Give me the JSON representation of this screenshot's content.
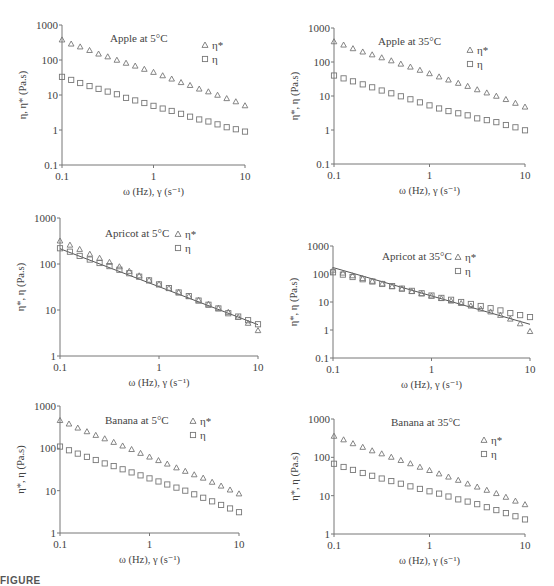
{
  "chart_data": [
    {
      "id": "apple5",
      "type": "scatter",
      "title": "Apple at 5°C",
      "xlabel": "ω (Hz), γ (s⁻¹)",
      "ylabel": "η, η* (Pa.s)",
      "xscale": "log",
      "yscale": "log",
      "xlim": [
        0.1,
        10
      ],
      "ylim": [
        0.1,
        1000
      ],
      "xticks": [
        "0.1",
        "1",
        "10"
      ],
      "yticks": [
        "0.1",
        "1",
        "10",
        "100",
        "1000"
      ],
      "legend": [
        {
          "marker": "triangle",
          "label": "η*"
        },
        {
          "marker": "square",
          "label": "η"
        }
      ],
      "x": [
        0.1,
        0.126,
        0.158,
        0.2,
        0.251,
        0.316,
        0.398,
        0.501,
        0.631,
        0.794,
        1.0,
        1.26,
        1.58,
        2.0,
        2.51,
        3.16,
        3.98,
        5.01,
        6.31,
        7.94,
        10.0
      ],
      "series": [
        {
          "name": "η*",
          "marker": "triangle",
          "values": [
            380,
            290,
            240,
            190,
            150,
            125,
            100,
            82,
            68,
            55,
            45,
            36,
            29,
            23,
            19,
            15,
            12.5,
            10,
            8,
            6.5,
            5
          ]
        },
        {
          "name": "η",
          "marker": "square",
          "values": [
            33,
            27,
            22,
            18,
            15,
            12.5,
            10.5,
            8.3,
            7,
            5.9,
            4.9,
            4.1,
            3.5,
            2.9,
            2.4,
            2.0,
            1.75,
            1.45,
            1.2,
            1.05,
            0.9
          ]
        }
      ],
      "fit_line": false
    },
    {
      "id": "apple35",
      "type": "scatter",
      "title": "Apple at 35°C",
      "xlabel": "ω (Hz), γ (s⁻¹)",
      "ylabel": "η*, η (Pa.s)",
      "xscale": "log",
      "yscale": "log",
      "xlim": [
        0.1,
        10
      ],
      "ylim": [
        0.1,
        1000
      ],
      "xticks": [
        "0.1",
        "1",
        "10"
      ],
      "yticks": [
        "0.1",
        "1",
        "10",
        "100",
        "1000"
      ],
      "legend": [
        {
          "marker": "triangle",
          "label": "η*"
        },
        {
          "marker": "square",
          "label": "η"
        }
      ],
      "x": [
        0.1,
        0.126,
        0.158,
        0.2,
        0.251,
        0.316,
        0.398,
        0.501,
        0.631,
        0.794,
        1.0,
        1.26,
        1.58,
        2.0,
        2.51,
        3.16,
        3.98,
        5.01,
        6.31,
        7.94,
        10.0
      ],
      "series": [
        {
          "name": "η*",
          "marker": "triangle",
          "values": [
            400,
            320,
            250,
            200,
            165,
            135,
            110,
            88,
            72,
            58,
            46,
            37,
            30,
            24,
            19.5,
            15.5,
            12.5,
            10,
            8,
            6.2,
            4.8
          ]
        },
        {
          "name": "η",
          "marker": "square",
          "values": [
            40,
            33,
            27,
            22,
            18,
            14.5,
            12,
            9.8,
            8,
            6.5,
            5.3,
            4.3,
            3.6,
            3.1,
            2.7,
            2.2,
            1.95,
            1.7,
            1.4,
            1.2,
            0.98
          ]
        }
      ],
      "fit_line": false
    },
    {
      "id": "apricot5",
      "type": "scatter",
      "title": "Apricot at 5°C",
      "xlabel": "ω (Hz), γ (s⁻¹)",
      "ylabel": "η*, η (Pa.s)",
      "xscale": "log",
      "yscale": "log",
      "xlim": [
        0.1,
        10
      ],
      "ylim": [
        1,
        1000
      ],
      "xticks": [
        "0.1",
        "1",
        "10"
      ],
      "yticks": [
        "1",
        "10",
        "100",
        "1000"
      ],
      "legend": [
        {
          "marker": "triangle",
          "label": "η*"
        },
        {
          "marker": "square",
          "label": "η"
        }
      ],
      "x": [
        0.1,
        0.126,
        0.158,
        0.2,
        0.251,
        0.316,
        0.398,
        0.501,
        0.631,
        0.794,
        1.0,
        1.26,
        1.58,
        2.0,
        2.51,
        3.16,
        3.98,
        5.01,
        6.31,
        7.94,
        10.0
      ],
      "series": [
        {
          "name": "η*",
          "marker": "triangle",
          "values": [
            320,
            260,
            210,
            165,
            135,
            110,
            88,
            70,
            56,
            45,
            37,
            30,
            24.5,
            20,
            16.5,
            13.5,
            11,
            9,
            7,
            5.2,
            3.6
          ]
        },
        {
          "name": "η",
          "marker": "square",
          "values": [
            220,
            185,
            150,
            125,
            105,
            90,
            75,
            63,
            53,
            44,
            36,
            30,
            24,
            20,
            16,
            13,
            10.8,
            8.5,
            7.2,
            6,
            4.9
          ]
        }
      ],
      "fit_line": true,
      "fit": {
        "x": [
          0.1,
          10
        ],
        "y": [
          215,
          4.8
        ]
      }
    },
    {
      "id": "apricot35",
      "type": "scatter",
      "title": "Apricot at 35°C",
      "xlabel": "ω (Hz), γ (s⁻¹)",
      "ylabel": "η*, η (Pa.s)",
      "xscale": "log",
      "yscale": "log",
      "xlim": [
        0.1,
        10
      ],
      "ylim": [
        0.1,
        1000
      ],
      "xticks": [
        "0.1",
        "1",
        "10"
      ],
      "yticks": [
        "0.1",
        "1",
        "10",
        "100",
        "1000"
      ],
      "legend": [
        {
          "marker": "triangle",
          "label": "η*"
        },
        {
          "marker": "square",
          "label": "η"
        }
      ],
      "x": [
        0.1,
        0.126,
        0.158,
        0.2,
        0.251,
        0.316,
        0.398,
        0.501,
        0.631,
        0.794,
        1.0,
        1.26,
        1.58,
        2.0,
        2.51,
        3.16,
        3.98,
        5.01,
        6.31,
        7.94,
        10.0
      ],
      "series": [
        {
          "name": "η*",
          "marker": "triangle",
          "values": [
            140,
            110,
            88,
            70,
            56,
            45,
            36,
            30,
            24,
            20,
            16.5,
            13.5,
            11,
            9,
            7.3,
            5.7,
            4.5,
            3.4,
            2.5,
            1.7,
            0.9
          ]
        },
        {
          "name": "η",
          "marker": "square",
          "values": [
            115,
            95,
            78,
            65,
            54,
            44,
            37,
            30,
            25,
            20.5,
            17,
            14,
            12,
            10,
            8.5,
            7.2,
            6,
            5,
            4,
            3.4,
            2.9
          ]
        }
      ],
      "fit_line": true,
      "fit": {
        "x": [
          0.1,
          10
        ],
        "y": [
          170,
          1.6
        ]
      }
    },
    {
      "id": "banana5",
      "type": "scatter",
      "title": "Banana at 5°C",
      "xlabel": "ω (Hz), γ (s⁻¹)",
      "ylabel": "η*, η (Pa.s)",
      "xscale": "log",
      "yscale": "log",
      "xlim": [
        0.1,
        10
      ],
      "ylim": [
        1,
        1000
      ],
      "xticks": [
        "0.1",
        "1",
        "10"
      ],
      "yticks": [
        "1",
        "10",
        "100",
        "1000"
      ],
      "legend": [
        {
          "marker": "triangle",
          "label": "η*"
        },
        {
          "marker": "square",
          "label": "η"
        }
      ],
      "x": [
        0.1,
        0.126,
        0.158,
        0.2,
        0.251,
        0.316,
        0.398,
        0.501,
        0.631,
        0.794,
        1.0,
        1.26,
        1.58,
        2.0,
        2.51,
        3.16,
        3.98,
        5.01,
        6.31,
        7.94,
        10.0
      ],
      "series": [
        {
          "name": "η*",
          "marker": "triangle",
          "values": [
            460,
            380,
            305,
            250,
            205,
            170,
            140,
            115,
            95,
            77,
            63,
            52,
            43,
            35,
            29,
            24,
            20,
            16,
            13,
            10.5,
            8.5
          ]
        },
        {
          "name": "η",
          "marker": "square",
          "values": [
            110,
            90,
            75,
            63,
            53,
            44,
            38,
            32,
            27,
            23,
            19.5,
            16.5,
            14,
            11.8,
            10,
            8.2,
            6.8,
            5.6,
            4.6,
            3.8,
            3.1
          ]
        }
      ],
      "fit_line": false
    },
    {
      "id": "banana35",
      "type": "scatter",
      "title": "Banana at 35°C",
      "xlabel": "ω (Hz), γ (s⁻¹)",
      "ylabel": "η*, η (Pa.s)",
      "xscale": "log",
      "yscale": "log",
      "xlim": [
        0.1,
        10
      ],
      "ylim": [
        1,
        1000
      ],
      "xticks": [
        "0.1",
        "1",
        "10"
      ],
      "yticks": [
        "1",
        "10",
        "100",
        "1000"
      ],
      "legend": [
        {
          "marker": "triangle",
          "label": "η*"
        },
        {
          "marker": "square",
          "label": "η"
        }
      ],
      "x": [
        0.1,
        0.126,
        0.158,
        0.2,
        0.251,
        0.316,
        0.398,
        0.501,
        0.631,
        0.794,
        1.0,
        1.26,
        1.58,
        2.0,
        2.51,
        3.16,
        3.98,
        5.01,
        6.31,
        7.94,
        10.0
      ],
      "series": [
        {
          "name": "η*",
          "marker": "triangle",
          "values": [
            360,
            290,
            230,
            185,
            150,
            125,
            102,
            84,
            69,
            56,
            46,
            37.5,
            31,
            25.5,
            20.5,
            17,
            14,
            11.5,
            9.2,
            7.3,
            5.9
          ]
        },
        {
          "name": "η",
          "marker": "square",
          "values": [
            68,
            56,
            47,
            39,
            33,
            28,
            24,
            20.5,
            17.5,
            15,
            13,
            11.3,
            9.5,
            8,
            7,
            6,
            5,
            4.2,
            3.5,
            2.9,
            2.4
          ]
        }
      ],
      "fit_line": false
    }
  ],
  "layout": {
    "panels": [
      {
        "id": "apple5",
        "x0": 62,
        "x1": 245,
        "ytop": 25,
        "ybot": 165,
        "title_x": 110,
        "title_y": 42,
        "leg_x": 205,
        "leg_y": 48
      },
      {
        "id": "apple35",
        "x0": 334,
        "x1": 525,
        "ytop": 28,
        "ybot": 164,
        "title_x": 378,
        "title_y": 45,
        "leg_x": 470,
        "leg_y": 53
      },
      {
        "id": "apricot5",
        "x0": 60,
        "x1": 258,
        "ytop": 218,
        "ybot": 356,
        "title_x": 105,
        "title_y": 237,
        "leg_x": 178,
        "leg_y": 237
      },
      {
        "id": "apricot35",
        "x0": 333,
        "x1": 530,
        "ytop": 246,
        "ybot": 358,
        "title_x": 382,
        "title_y": 260,
        "leg_x": 458,
        "leg_y": 260
      },
      {
        "id": "banana5",
        "x0": 60,
        "x1": 239,
        "ytop": 406,
        "ybot": 533,
        "title_x": 105,
        "title_y": 424,
        "leg_x": 193,
        "leg_y": 424
      },
      {
        "id": "banana35",
        "x0": 334,
        "x1": 525,
        "ytop": 419,
        "ybot": 534,
        "title_x": 391,
        "title_y": 426,
        "leg_x": 484,
        "leg_y": 443
      }
    ]
  },
  "caption": {
    "text": "FIGURE"
  }
}
